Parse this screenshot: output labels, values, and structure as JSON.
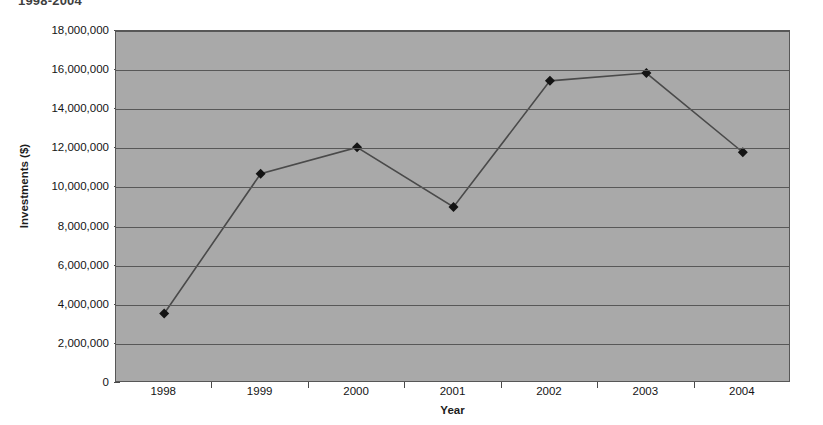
{
  "chart_data": {
    "type": "line",
    "title": "1998-2004",
    "xlabel": "Year",
    "ylabel": "Investments ($)",
    "categories": [
      "1998",
      "1999",
      "2000",
      "2001",
      "2002",
      "2003",
      "2004"
    ],
    "values": [
      3550000,
      10700000,
      12050000,
      9000000,
      15450000,
      15850000,
      11800000
    ],
    "ylim": [
      0,
      18000000
    ],
    "ytick_labels": [
      "18,000,000",
      "16,000,000",
      "14,000,000",
      "12,000,000",
      "10,000,000",
      "8,000,000",
      "6,000,000",
      "4,000,000",
      "2,000,000",
      "0"
    ],
    "ytick_values": [
      18000000,
      16000000,
      14000000,
      12000000,
      10000000,
      8000000,
      6000000,
      4000000,
      2000000,
      0
    ],
    "ytick_interval": 2000000,
    "grid": true,
    "legend": false,
    "series": [
      {
        "name": "Investments",
        "values": [
          3550000,
          10700000,
          12050000,
          9000000,
          15450000,
          15850000,
          11800000
        ],
        "marker": "diamond",
        "line_color": "#4a4a4a",
        "marker_color": "#141414"
      }
    ],
    "plot_background_color": "#a9a9a9",
    "gridline_color": "#585858",
    "axis_color": "#575757",
    "page_background_color": "#ffffff"
  }
}
